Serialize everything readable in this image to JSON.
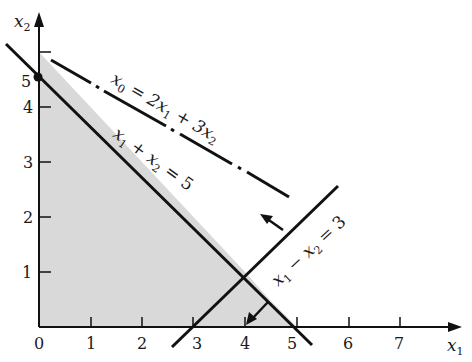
{
  "figure": {
    "type": "linear-programming-feasible-region",
    "axes": {
      "x_label": "x",
      "x_label_sub": "1",
      "y_label": "x",
      "y_label_sub": "2",
      "x_ticks": [
        "0",
        "1",
        "2",
        "3",
        "4",
        "5",
        "6",
        "7"
      ],
      "y_ticks": [
        "1",
        "2",
        "3",
        "4",
        "5"
      ]
    },
    "constraints": [
      {
        "label_parts": [
          "x",
          "1",
          " + x",
          "2",
          " = 5"
        ],
        "text": "x1 + x2 = 5"
      },
      {
        "label_parts": [
          "x",
          "1",
          " − x",
          "2",
          " = 3"
        ],
        "text": "x1 − x2 = 3"
      }
    ],
    "objective": {
      "label_parts": [
        "x",
        "0",
        " = 2x",
        "1",
        " + 3x",
        "2"
      ],
      "text": "x0 = 2x1 + 3x2",
      "style": "dash-dot"
    },
    "feasible_region": {
      "vertices": [
        [
          0,
          0
        ],
        [
          0,
          5
        ],
        [
          4,
          1
        ],
        [
          3,
          0
        ]
      ],
      "fill": "#d9d9d9"
    },
    "colors": {
      "line": "#111111",
      "region": "#d9d9d9",
      "background": "#ffffff"
    }
  }
}
